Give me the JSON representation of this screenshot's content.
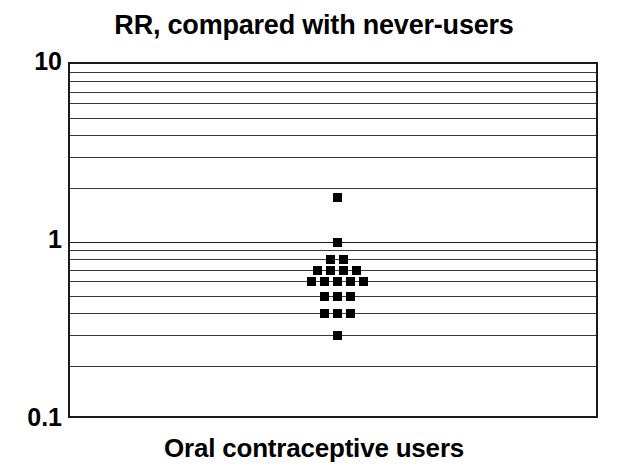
{
  "chart_data": {
    "type": "scatter",
    "title": "RR, compared with never-users",
    "xlabel": "Oral contraceptive users",
    "ylabel": "",
    "yscale": "log",
    "ylim": [
      0.1,
      10
    ],
    "grid": true,
    "legend": null,
    "ytick_labels": [
      "10",
      "1",
      "0.1"
    ],
    "ytick_values": [
      10,
      1,
      0.1
    ],
    "minor_gridline_values": [
      9,
      8,
      7,
      6,
      5,
      4,
      3,
      2,
      0.9,
      0.8,
      0.7,
      0.6,
      0.5,
      0.4,
      0.3,
      0.2
    ],
    "xcategory": "Oral contraceptive users",
    "marker": "square",
    "marker_color": "#000000",
    "stacks": [
      {
        "value": 1.8,
        "count": 1
      },
      {
        "value": 1.0,
        "count": 1
      },
      {
        "value": 0.8,
        "count": 2
      },
      {
        "value": 0.7,
        "count": 4
      },
      {
        "value": 0.6,
        "count": 5
      },
      {
        "value": 0.5,
        "count": 3
      },
      {
        "value": 0.4,
        "count": 3
      },
      {
        "value": 0.3,
        "count": 1
      }
    ],
    "values": [
      1.8,
      1.0,
      0.8,
      0.8,
      0.7,
      0.7,
      0.7,
      0.7,
      0.6,
      0.6,
      0.6,
      0.6,
      0.6,
      0.5,
      0.5,
      0.5,
      0.4,
      0.4,
      0.4,
      0.3
    ],
    "total_points": 20
  },
  "colors": {
    "background": "#ffffff",
    "axis": "#1a1a1a",
    "gridline": "#3a3a3a",
    "marker": "#000000",
    "text": "#000000"
  }
}
